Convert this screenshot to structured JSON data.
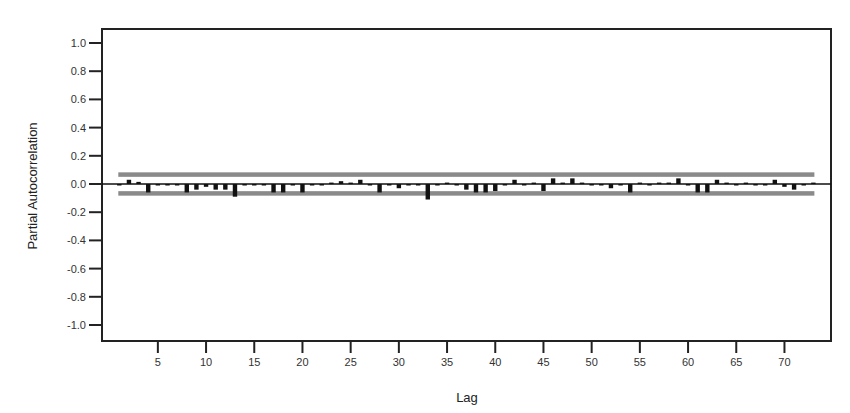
{
  "chart_data": {
    "type": "bar",
    "title": "",
    "xlabel": "Lag",
    "ylabel": "Partial Autocorrelation",
    "ylim": [
      -1.1,
      1.1
    ],
    "yticks": [
      1.0,
      0.8,
      0.6,
      0.4,
      0.2,
      0.0,
      -0.2,
      -0.4,
      -0.6,
      -0.8,
      -1.0
    ],
    "ytick_labels": [
      "1.0",
      "0.8",
      "0.6",
      "0.4",
      "0.2",
      "0.0",
      "-0.2",
      "-0.4",
      "-0.6",
      "-0.8",
      "-1.0"
    ],
    "xticks": [
      5,
      10,
      15,
      20,
      25,
      30,
      35,
      40,
      45,
      50,
      55,
      60,
      65,
      70
    ],
    "xtick_labels": [
      "5",
      "10",
      "15",
      "20",
      "25",
      "30",
      "35",
      "40",
      "45",
      "50",
      "55",
      "60",
      "65",
      "70"
    ],
    "grid": false,
    "legend": null,
    "confidence_limits": {
      "upper": 0.065,
      "lower": -0.065,
      "color": "#8a8a8a"
    },
    "series": [
      {
        "name": "Partial ACF",
        "lags": [
          1,
          2,
          3,
          4,
          5,
          6,
          7,
          8,
          9,
          10,
          11,
          12,
          13,
          14,
          15,
          16,
          17,
          18,
          19,
          20,
          21,
          22,
          23,
          24,
          25,
          26,
          27,
          28,
          29,
          30,
          31,
          32,
          33,
          34,
          35,
          36,
          37,
          38,
          39,
          40,
          41,
          42,
          43,
          44,
          45,
          46,
          47,
          48,
          49,
          50,
          51,
          52,
          53,
          54,
          55,
          56,
          57,
          58,
          59,
          60,
          61,
          62,
          63,
          64,
          65,
          66,
          67,
          68,
          69,
          70,
          71,
          72,
          73
        ],
        "values": [
          -0.01,
          0.03,
          0.015,
          -0.06,
          -0.01,
          0.0,
          0.0,
          -0.06,
          -0.04,
          -0.02,
          -0.04,
          -0.04,
          -0.09,
          -0.01,
          -0.01,
          -0.01,
          -0.06,
          -0.06,
          0.0,
          -0.06,
          -0.01,
          -0.01,
          0.01,
          0.02,
          0.01,
          0.03,
          -0.01,
          -0.06,
          0.0,
          -0.03,
          0.0,
          -0.01,
          -0.11,
          0.0,
          0.01,
          0.0,
          -0.04,
          -0.06,
          -0.06,
          -0.05,
          -0.01,
          0.03,
          0.0,
          0.01,
          -0.05,
          0.04,
          0.01,
          0.04,
          0.01,
          0.0,
          -0.01,
          -0.03,
          0.0,
          -0.06,
          0.01,
          0.0,
          0.01,
          0.01,
          0.04,
          -0.01,
          -0.06,
          -0.06,
          0.03,
          0.01,
          0.0,
          0.01,
          0.0,
          -0.01,
          0.03,
          -0.02,
          -0.04,
          -0.01,
          0.01
        ]
      }
    ]
  }
}
